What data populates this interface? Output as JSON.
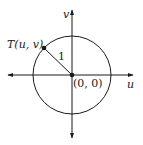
{
  "diagram": {
    "type": "unit-circle",
    "axes": {
      "horizontal_label": "u",
      "vertical_label": "v"
    },
    "origin_label": "(0, 0)",
    "point_label": "T(u, v)",
    "radius_label": "1",
    "colors": {
      "stroke": "#1a1a1a",
      "background": "#ffffff"
    }
  }
}
